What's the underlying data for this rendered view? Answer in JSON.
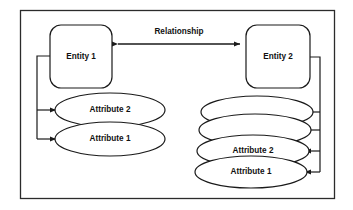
{
  "diagram": {
    "type": "entity-relationship-diagram",
    "frame": {
      "present": true,
      "border_color": "#2b2b2b",
      "background": "#ffffff"
    },
    "entities": [
      {
        "id": "entity1",
        "label": "Entity 1"
      },
      {
        "id": "entity2",
        "label": "Entity 2"
      }
    ],
    "relationship": {
      "label": "Relationship",
      "from": "Entity 1",
      "to": "Entity 2",
      "arrow_style": "double-headed"
    },
    "left_attributes": [
      {
        "id": "left-attr-2",
        "label": "Attribute 2"
      },
      {
        "id": "left-attr-1",
        "label": "Attribute 1"
      }
    ],
    "right_attributes": [
      {
        "id": "right-attr-4",
        "label": ""
      },
      {
        "id": "right-attr-3",
        "label": ""
      },
      {
        "id": "right-attr-2",
        "label": "Attribute 2"
      },
      {
        "id": "right-attr-1",
        "label": "Attribute 1"
      }
    ],
    "colors": {
      "stroke": "#1a1a1a",
      "frame_stroke": "#2b2b2b",
      "fill": "#ffffff",
      "text": "#111111"
    }
  }
}
